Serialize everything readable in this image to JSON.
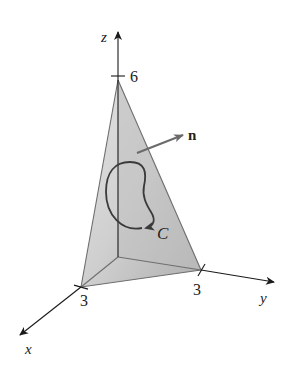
{
  "figure": {
    "axes": {
      "x": {
        "label": "x",
        "tick_label": "3"
      },
      "y": {
        "label": "y",
        "tick_label": "3"
      },
      "z": {
        "label": "z",
        "tick_label": "6"
      }
    },
    "normal_vector": {
      "label": "n"
    },
    "curve": {
      "label": "C"
    },
    "colors": {
      "axis": "#1a1a1a",
      "face_front": "#c8c8c8",
      "face_left": "#dedede",
      "face_bottom": "#e6e6e6",
      "edge": "#6e6e6e",
      "curve": "#3a3a3a",
      "normal_arrow": "#6a6a6a"
    }
  }
}
